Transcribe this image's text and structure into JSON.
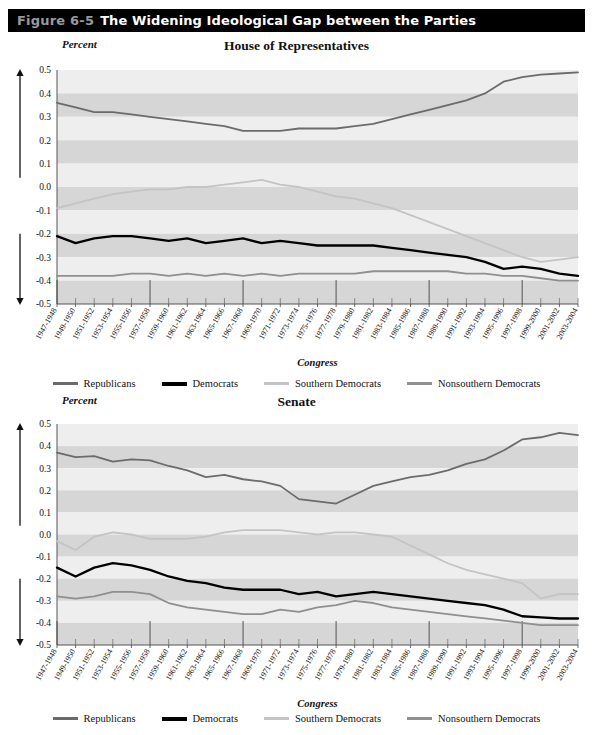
{
  "figure": {
    "number": "Figure 6-5",
    "title": "The Widening Ideological Gap between the Parties",
    "bar_bg": "#000000",
    "number_color": "#9a9a9a",
    "title_color": "#ffffff"
  },
  "series_colors": {
    "republicans": "#6b6b6b",
    "democrats": "#000000",
    "southern_democrats": "#c4c4c4",
    "nonsouthern_democrats": "#8f8f8f"
  },
  "legend": {
    "items": [
      {
        "label": "Republicans",
        "color": "#6b6b6b",
        "width": 3
      },
      {
        "label": "Democrats",
        "color": "#000000",
        "width": 4
      },
      {
        "label": "Southern Democrats",
        "color": "#c4c4c4",
        "width": 3
      },
      {
        "label": "Nonsouthern Democrats",
        "color": "#8f8f8f",
        "width": 3
      }
    ]
  },
  "axis": {
    "y_title": "Percent",
    "y_top_annotation": "More conservative",
    "y_bottom_annotation": "More liberal",
    "x_title": "Congress",
    "y_ticks": [
      "0.5",
      "0.4",
      "0.3",
      "0.2",
      "0.1",
      "0.0",
      "-0.1",
      "-0.2",
      "-0.3",
      "-0.4",
      "-0.5"
    ]
  },
  "chart_data": [
    {
      "type": "line",
      "title": "House of Representatives",
      "xlabel": "Congress",
      "ylabel": "Percent",
      "ylim": [
        -0.5,
        0.5
      ],
      "ytick_step": 0.1,
      "grid": "horizontal-bands",
      "legend_position": "bottom",
      "categories": [
        "1947-1948",
        "1949-1950",
        "1951-1952",
        "1953-1954",
        "1955-1956",
        "1957-1958",
        "1959-1960",
        "1961-1962",
        "1963-1964",
        "1965-1966",
        "1967-1968",
        "1969-1970",
        "1971-1972",
        "1973-1974",
        "1975-1976",
        "1977-1978",
        "1979-1980",
        "1981-1982",
        "1983-1984",
        "1985-1986",
        "1987-1988",
        "1989-1990",
        "1991-1992",
        "1993-1994",
        "1995-1996",
        "1997-1998",
        "1999-2000",
        "2001-2002",
        "2003-2004"
      ],
      "series": [
        {
          "name": "Republicans",
          "color": "#6b6b6b",
          "values": [
            0.36,
            0.34,
            0.32,
            0.32,
            0.31,
            0.3,
            0.29,
            0.28,
            0.27,
            0.26,
            0.24,
            0.24,
            0.24,
            0.25,
            0.25,
            0.25,
            0.26,
            0.27,
            0.29,
            0.31,
            0.33,
            0.35,
            0.37,
            0.4,
            0.45,
            0.47,
            0.48,
            0.485,
            0.49
          ]
        },
        {
          "name": "Democrats",
          "color": "#000000",
          "values": [
            -0.21,
            -0.24,
            -0.22,
            -0.21,
            -0.21,
            -0.22,
            -0.23,
            -0.22,
            -0.24,
            -0.23,
            -0.22,
            -0.24,
            -0.23,
            -0.24,
            -0.25,
            -0.25,
            -0.25,
            -0.25,
            -0.26,
            -0.27,
            -0.28,
            -0.29,
            -0.3,
            -0.32,
            -0.35,
            -0.34,
            -0.35,
            -0.37,
            -0.38
          ]
        },
        {
          "name": "Southern Democrats",
          "color": "#c4c4c4",
          "values": [
            -0.09,
            -0.07,
            -0.05,
            -0.03,
            -0.02,
            -0.01,
            -0.01,
            0.0,
            0.0,
            0.01,
            0.02,
            0.03,
            0.01,
            0.0,
            -0.02,
            -0.04,
            -0.05,
            -0.07,
            -0.09,
            -0.12,
            -0.15,
            -0.18,
            -0.21,
            -0.24,
            -0.27,
            -0.3,
            -0.32,
            -0.31,
            -0.3
          ]
        },
        {
          "name": "Nonsouthern Democrats",
          "color": "#8f8f8f",
          "values": [
            -0.38,
            -0.38,
            -0.38,
            -0.38,
            -0.37,
            -0.37,
            -0.38,
            -0.37,
            -0.38,
            -0.37,
            -0.38,
            -0.37,
            -0.38,
            -0.37,
            -0.37,
            -0.37,
            -0.37,
            -0.36,
            -0.36,
            -0.36,
            -0.36,
            -0.36,
            -0.37,
            -0.37,
            -0.38,
            -0.38,
            -0.39,
            -0.4,
            -0.4
          ]
        }
      ]
    },
    {
      "type": "line",
      "title": "Senate",
      "xlabel": "Congress",
      "ylabel": "Percent",
      "ylim": [
        -0.5,
        0.5
      ],
      "ytick_step": 0.1,
      "grid": "horizontal-bands",
      "legend_position": "bottom",
      "categories": [
        "1947-1948",
        "1949-1950",
        "1951-1952",
        "1953-1954",
        "1955-1956",
        "1957-1958",
        "1959-1960",
        "1961-1962",
        "1963-1964",
        "1965-1966",
        "1967-1968",
        "1969-1970",
        "1971-1972",
        "1973-1974",
        "1975-1976",
        "1977-1978",
        "1979-1980",
        "1981-1982",
        "1983-1984",
        "1985-1986",
        "1987-1988",
        "1989-1990",
        "1991-1992",
        "1993-1994",
        "1995-1996",
        "1997-1998",
        "1999-2000",
        "2001-2002",
        "2003-2004"
      ],
      "series": [
        {
          "name": "Republicans",
          "color": "#6b6b6b",
          "values": [
            0.37,
            0.35,
            0.355,
            0.33,
            0.34,
            0.335,
            0.31,
            0.29,
            0.26,
            0.27,
            0.25,
            0.24,
            0.22,
            0.16,
            0.15,
            0.14,
            0.18,
            0.22,
            0.24,
            0.26,
            0.27,
            0.29,
            0.32,
            0.34,
            0.38,
            0.43,
            0.44,
            0.46,
            0.45
          ]
        },
        {
          "name": "Democrats",
          "color": "#000000",
          "values": [
            -0.15,
            -0.19,
            -0.15,
            -0.13,
            -0.14,
            -0.16,
            -0.19,
            -0.21,
            -0.22,
            -0.24,
            -0.25,
            -0.25,
            -0.25,
            -0.27,
            -0.26,
            -0.28,
            -0.27,
            -0.26,
            -0.27,
            -0.28,
            -0.29,
            -0.3,
            -0.31,
            -0.32,
            -0.34,
            -0.37,
            -0.375,
            -0.38,
            -0.38
          ]
        },
        {
          "name": "Southern Democrats",
          "color": "#c4c4c4",
          "values": [
            -0.03,
            -0.07,
            -0.01,
            0.01,
            0.0,
            -0.02,
            -0.02,
            -0.02,
            -0.01,
            0.01,
            0.02,
            0.02,
            0.02,
            0.01,
            0.0,
            0.01,
            0.01,
            0.0,
            -0.01,
            -0.05,
            -0.09,
            -0.13,
            -0.16,
            -0.18,
            -0.2,
            -0.22,
            -0.29,
            -0.27,
            -0.27
          ]
        },
        {
          "name": "Nonsouthern Democrats",
          "color": "#8f8f8f",
          "values": [
            -0.28,
            -0.29,
            -0.28,
            -0.26,
            -0.26,
            -0.27,
            -0.31,
            -0.33,
            -0.34,
            -0.35,
            -0.36,
            -0.36,
            -0.34,
            -0.35,
            -0.33,
            -0.32,
            -0.3,
            -0.31,
            -0.33,
            -0.34,
            -0.35,
            -0.36,
            -0.37,
            -0.38,
            -0.39,
            -0.4,
            -0.41,
            -0.41,
            -0.41
          ]
        }
      ]
    }
  ]
}
